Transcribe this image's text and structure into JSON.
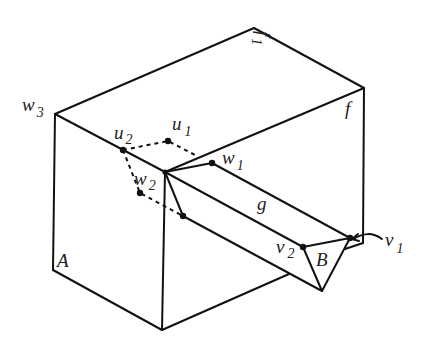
{
  "figure": {
    "type": "geometric diagram",
    "labels": {
      "w3": {
        "base": "w",
        "sub": "3"
      },
      "f1": {
        "base": "f",
        "sub": "1"
      },
      "f": {
        "base": "f",
        "sub": ""
      },
      "u1": {
        "base": "u",
        "sub": "1"
      },
      "u2": {
        "base": "u",
        "sub": "2"
      },
      "w1": {
        "base": "w",
        "sub": "1"
      },
      "w2": {
        "base": "w",
        "sub": "2"
      },
      "g": {
        "base": "g",
        "sub": ""
      },
      "v1": {
        "base": "v",
        "sub": "1"
      },
      "v2": {
        "base": "v",
        "sub": "2"
      },
      "A": {
        "base": "A",
        "sub": ""
      },
      "B": {
        "base": "B",
        "sub": ""
      }
    },
    "colors": {
      "line": "#111111",
      "background": "#ffffff"
    }
  }
}
